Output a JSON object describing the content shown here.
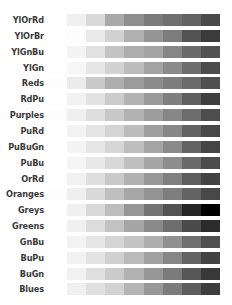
{
  "figure": {
    "kind": "colormap-reference",
    "rendering": "grayscale",
    "background_color": "#ffffff",
    "label_color": "#3a3a3a",
    "row_count": 17,
    "levels_per_row": 9
  },
  "chart_data": {
    "type": "heatmap",
    "title": "",
    "subtitle": "",
    "xlabel": "",
    "ylabel": "",
    "grid": false,
    "legend": "none",
    "x_tick_labels": [],
    "categories": [
      "YlOrRd",
      "YlOrBr",
      "YlGnBu",
      "YlGn",
      "Reds",
      "RdPu",
      "Purples",
      "PuRd",
      "PuBuGn",
      "PuBu",
      "OrRd",
      "Oranges",
      "Greys",
      "Greens",
      "GnBu",
      "BuPu",
      "BuGn",
      "Blues"
    ],
    "rows": [
      {
        "name": "YlOrRd",
        "values": [
          0,
          1,
          2,
          3,
          4,
          5,
          6,
          7,
          8
        ],
        "colors": [
          "#ffffff",
          "#f0f0f0",
          "#dadada",
          "#a9a9a9",
          "#8e8e8e",
          "#7b7b7b",
          "#6f6f6f",
          "#636363",
          "#4a4a4a"
        ]
      },
      {
        "name": "YlOrBr",
        "values": [
          0,
          1,
          2,
          3,
          4,
          5,
          6,
          7,
          8
        ],
        "colors": [
          "#ffffff",
          "#fdfdfd",
          "#eaeaea",
          "#d2d2d2",
          "#b0b0b0",
          "#959595",
          "#7c7c7c",
          "#535353",
          "#3b3b3b"
        ]
      },
      {
        "name": "YlGnBu",
        "values": [
          0,
          1,
          2,
          3,
          4,
          5,
          6,
          7,
          8
        ],
        "colors": [
          "#ffffff",
          "#f4f4f4",
          "#e1e1e1",
          "#c3c3c3",
          "#aeaeae",
          "#a4a4a4",
          "#868686",
          "#6a6a6a",
          "#515151"
        ]
      },
      {
        "name": "YlGn",
        "values": [
          0,
          1,
          2,
          3,
          4,
          5,
          6,
          7,
          8
        ],
        "colors": [
          "#ffffff",
          "#f6f6f6",
          "#e6e6e6",
          "#d2d2d2",
          "#bcbcbc",
          "#a3a3a3",
          "#8a8a8a",
          "#6d6d6d",
          "#4c4c4c"
        ]
      },
      {
        "name": "Reds",
        "values": [
          0,
          1,
          2,
          3,
          4,
          5,
          6,
          7,
          8
        ],
        "colors": [
          "#fdfdfd",
          "#ececec",
          "#c9c9c9",
          "#aeaeae",
          "#9b9b9b",
          "#8b8b8b",
          "#7d7d7d",
          "#6b6b6b",
          "#4f4f4f"
        ]
      },
      {
        "name": "RdPu",
        "values": [
          0,
          1,
          2,
          3,
          4,
          5,
          6,
          7,
          8
        ],
        "colors": [
          "#ffffff",
          "#f2f2f2",
          "#e2e2e2",
          "#cccccc",
          "#b3b3b3",
          "#9a9a9a",
          "#7f7f7f",
          "#5f5f5f",
          "#3f3f3f"
        ]
      },
      {
        "name": "Purples",
        "values": [
          0,
          1,
          2,
          3,
          4,
          5,
          6,
          7,
          8
        ],
        "colors": [
          "#fdfdfd",
          "#efefef",
          "#dedede",
          "#c8c8c8",
          "#b2b2b2",
          "#9d9d9d",
          "#878787",
          "#6c6c6c",
          "#4d4d4d"
        ]
      },
      {
        "name": "PuRd",
        "values": [
          0,
          1,
          2,
          3,
          4,
          5,
          6,
          7,
          8
        ],
        "colors": [
          "#ffffff",
          "#f3f3f3",
          "#e4e4e4",
          "#d4d4d4",
          "#bcbcbc",
          "#9f9f9f",
          "#878787",
          "#636363",
          "#484848"
        ]
      },
      {
        "name": "PuBuGn",
        "values": [
          0,
          1,
          2,
          3,
          4,
          5,
          6,
          7,
          8
        ],
        "colors": [
          "#ffffff",
          "#f4f4f4",
          "#e6e6e6",
          "#d6d6d6",
          "#bebebe",
          "#a5a5a5",
          "#8a8a8a",
          "#636363",
          "#454545"
        ]
      },
      {
        "name": "PuBu",
        "values": [
          0,
          1,
          2,
          3,
          4,
          5,
          6,
          7,
          8
        ],
        "colors": [
          "#ffffff",
          "#f5f5f5",
          "#e8e8e8",
          "#d8d8d8",
          "#c0c0c0",
          "#a6a6a6",
          "#8d8d8d",
          "#6a6a6a",
          "#4c4c4c"
        ]
      },
      {
        "name": "OrRd",
        "values": [
          0,
          1,
          2,
          3,
          4,
          5,
          6,
          7,
          8
        ],
        "colors": [
          "#ffffff",
          "#f1f1f1",
          "#dfdfdf",
          "#c9c9c9",
          "#b1b1b1",
          "#989898",
          "#808080",
          "#5e5e5e",
          "#434343"
        ]
      },
      {
        "name": "Oranges",
        "values": [
          0,
          1,
          2,
          3,
          4,
          5,
          6,
          7,
          8
        ],
        "colors": [
          "#fdfdfd",
          "#efefef",
          "#d9d9d9",
          "#bfbfbf",
          "#a7a7a7",
          "#939393",
          "#7e7e7e",
          "#636363",
          "#484848"
        ]
      },
      {
        "name": "Greys",
        "values": [
          0,
          1,
          2,
          3,
          4,
          5,
          6,
          7,
          8
        ],
        "colors": [
          "#ffffff",
          "#f0f0f0",
          "#d9d9d9",
          "#bdbdbd",
          "#969696",
          "#737373",
          "#525252",
          "#252525",
          "#000000"
        ]
      },
      {
        "name": "Greens",
        "values": [
          0,
          1,
          2,
          3,
          4,
          5,
          6,
          7,
          8
        ],
        "colors": [
          "#ffffff",
          "#f0f0f0",
          "#dcdcdc",
          "#c2c2c2",
          "#a6a6a6",
          "#8a8a8a",
          "#6e6e6e",
          "#4b4b4b",
          "#2b2b2b"
        ]
      },
      {
        "name": "GnBu",
        "values": [
          0,
          1,
          2,
          3,
          4,
          5,
          6,
          7,
          8
        ],
        "colors": [
          "#ffffff",
          "#f3f3f3",
          "#e6e6e6",
          "#d5d5d5",
          "#c3c3c3",
          "#aeaeae",
          "#909090",
          "#6f6f6f",
          "#4f4f4f"
        ]
      },
      {
        "name": "BuPu",
        "values": [
          0,
          1,
          2,
          3,
          4,
          5,
          6,
          7,
          8
        ],
        "colors": [
          "#ffffff",
          "#f2f2f2",
          "#e3e3e3",
          "#d0d0d0",
          "#bababa",
          "#a1a1a1",
          "#868686",
          "#636363",
          "#434343"
        ]
      },
      {
        "name": "BuGn",
        "values": [
          0,
          1,
          2,
          3,
          4,
          5,
          6,
          7,
          8
        ],
        "colors": [
          "#ffffff",
          "#f1f1f1",
          "#e0e0e0",
          "#cbcbcb",
          "#b2b2b2",
          "#979797",
          "#7b7b7b",
          "#575757",
          "#383838"
        ]
      },
      {
        "name": "Blues",
        "values": [
          0,
          1,
          2,
          3,
          4,
          5,
          6,
          7,
          8
        ],
        "colors": [
          "#ffffff",
          "#f0f0f0",
          "#e0e0e0",
          "#d2d2d2",
          "#b5b5b5",
          "#989898",
          "#7c7c7c",
          "#5e5e5e",
          "#3e3e3e"
        ]
      }
    ]
  },
  "rows_visible": [
    "YlOrRd",
    "YlOrBr",
    "YlGnBu",
    "YlGn",
    "Reds",
    "RdPu",
    "Purples",
    "PuRd",
    "PuBuGn",
    "PuBu",
    "OrRd",
    "Oranges",
    "Greys",
    "Greens",
    "GnBu",
    "BuPu",
    "BuGn",
    "Blues"
  ]
}
